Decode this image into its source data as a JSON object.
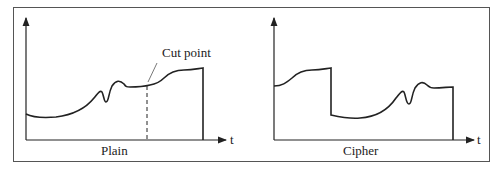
{
  "panels": [
    {
      "caption": "Plain",
      "axis_label_x": "t",
      "annotation": "Cut point"
    },
    {
      "caption": "Cipher",
      "axis_label_x": "t"
    }
  ],
  "colors": {
    "stroke": "#222222",
    "frame": "#555555",
    "background": "#ffffff"
  }
}
